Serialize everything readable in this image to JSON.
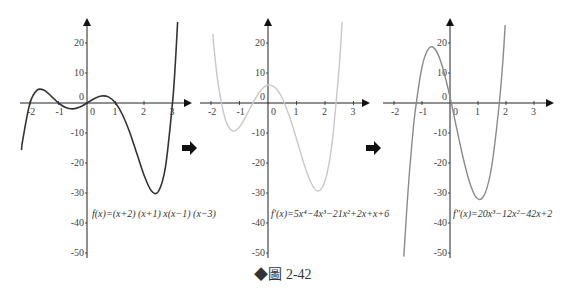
{
  "caption": {
    "marker": "◆",
    "label": "圖 2-42"
  },
  "arrows": [
    {
      "icon": "right-arrow-icon"
    },
    {
      "icon": "right-arrow-icon"
    }
  ],
  "chart_data": [
    {
      "type": "line",
      "title": "",
      "formula": "f(x)=(x+2) (x+1) x(x−1) (x−3)",
      "xticks": [
        "-2",
        "-1",
        "0",
        "1",
        "2",
        "3"
      ],
      "yticks": [
        "20",
        "10",
        "0",
        "-10",
        "-20",
        "-30",
        "-40",
        "-50"
      ],
      "xlim": [
        -2.4,
        3.5
      ],
      "ylim": [
        -52,
        27
      ],
      "color": "#333333",
      "series": [
        {
          "name": "f(x)",
          "x": [
            -2.3,
            -2.25,
            -2,
            -1.75,
            -1.5,
            -1.25,
            -1,
            -0.75,
            -0.5,
            -0.25,
            0,
            0.25,
            0.5,
            0.75,
            1,
            1.25,
            1.5,
            1.75,
            2,
            2.25,
            2.5,
            2.75,
            3,
            3.1,
            3.18
          ],
          "y": [
            -15.7,
            -12.0,
            0,
            4.29,
            4.22,
            2.24,
            0,
            -1.54,
            -1.97,
            -1.33,
            0,
            1.45,
            2.34,
            2.03,
            0,
            -4.0,
            -9.84,
            -16.92,
            -24,
            -29.14,
            -29.53,
            -21.43,
            0,
            13.6,
            27
          ]
        }
      ]
    },
    {
      "type": "line",
      "title": "",
      "formula": "f′(x)=5x⁴−4x³−21x²+2x+x+6",
      "xticks": [
        "-2",
        "-1",
        "0",
        "1",
        "2",
        "3"
      ],
      "yticks": [
        "20",
        "10",
        "0",
        "-10",
        "-20",
        "-30",
        "-40",
        "-50"
      ],
      "xlim": [
        -2.2,
        3.5
      ],
      "ylim": [
        -52,
        27
      ],
      "color": "#c8c8c8",
      "series": [
        {
          "name": "f'(x)",
          "x": [
            -1.93,
            -1.9,
            -1.75,
            -1.5,
            -1.25,
            -1,
            -0.75,
            -0.5,
            -0.25,
            0,
            0.25,
            0.5,
            0.75,
            1,
            1.25,
            1.5,
            1.75,
            2,
            2.25,
            2.5,
            2.6
          ],
          "y": [
            23,
            18.99,
            6.53,
            -5.44,
            -9.29,
            -8,
            -4.04,
            0.56,
            4.27,
            6,
            5.14,
            1.56,
            -4.42,
            -12,
            -19.91,
            -26.44,
            -29.35,
            -26,
            -13.27,
            12.55,
            27
          ]
        }
      ]
    },
    {
      "type": "line",
      "title": "",
      "formula": "f″(x)=20x³−12x²−42x+2",
      "xticks": [
        "-2",
        "-1",
        "0",
        "1",
        "2",
        "3"
      ],
      "yticks": [
        "20",
        "10",
        "0",
        "-10",
        "-20",
        "-30",
        "-40",
        "-50"
      ],
      "xlim": [
        -2.2,
        3.5
      ],
      "ylim": [
        -52,
        27
      ],
      "color": "#8a8a8a",
      "series": [
        {
          "name": "f''(x)",
          "x": [
            -1.65,
            -1.5,
            -1.35,
            -1.25,
            -1,
            -0.75,
            -0.5,
            -0.25,
            0,
            0.25,
            0.5,
            0.75,
            1,
            1.25,
            1.5,
            1.75,
            1.9,
            1.97
          ],
          "y": [
            -51.2,
            -29.5,
            -12.4,
            -3.31,
            12,
            18.31,
            17.5,
            11.44,
            2,
            -8.94,
            -19.5,
            -27.81,
            -32,
            -30.19,
            -20.5,
            -1.05,
            15.5,
            26
          ]
        }
      ]
    }
  ]
}
